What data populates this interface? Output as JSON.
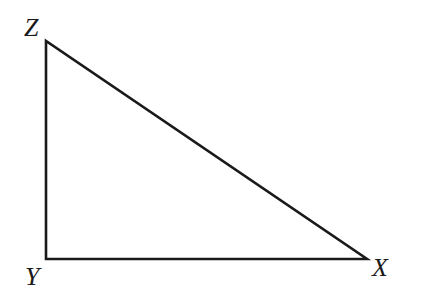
{
  "diagram": {
    "type": "right-triangle",
    "stroke_color": "#1a1a1a",
    "background": "#ffffff",
    "vertices": {
      "Z": {
        "label": "Z",
        "x": 46,
        "y": 41
      },
      "Y": {
        "label": "Y",
        "x": 46,
        "y": 259
      },
      "X": {
        "label": "X",
        "x": 367,
        "y": 259
      }
    },
    "right_angle_at": "Y",
    "sides": [
      {
        "name": "ZY",
        "from": "Z",
        "to": "Y"
      },
      {
        "name": "YX",
        "from": "Y",
        "to": "X"
      },
      {
        "name": "XZ",
        "from": "X",
        "to": "Z"
      }
    ]
  }
}
